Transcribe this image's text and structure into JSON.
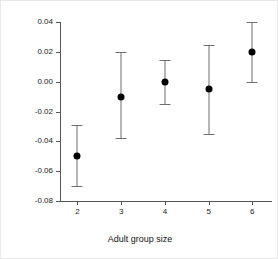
{
  "chart_data": {
    "type": "scatter",
    "title": "",
    "subtitle": "",
    "xlabel": "Adult group size",
    "ylabel": "Proportion of body mass gained",
    "categories": [
      "2",
      "3",
      "4",
      "5",
      "6"
    ],
    "x": [
      2,
      3,
      4,
      5,
      6
    ],
    "values": [
      -0.05,
      -0.01,
      0.0,
      -0.005,
      0.02
    ],
    "error_low": [
      -0.07,
      -0.0375,
      -0.015,
      -0.035,
      -0.0005
    ],
    "error_high": [
      -0.029,
      0.02,
      0.0145,
      0.0245,
      0.04
    ],
    "series": [
      {
        "name": "Proportion of body mass gained",
        "values": [
          -0.05,
          -0.01,
          0.0,
          -0.005,
          0.02
        ],
        "error_low": [
          -0.07,
          -0.0375,
          -0.015,
          -0.035,
          -0.0005
        ],
        "error_high": [
          -0.029,
          0.02,
          0.0145,
          0.0245,
          0.04
        ]
      }
    ],
    "points": [
      {
        "x": 2,
        "y": -0.05,
        "low": -0.07,
        "high": -0.029
      },
      {
        "x": 3,
        "y": -0.01,
        "low": -0.0375,
        "high": 0.02
      },
      {
        "x": 4,
        "y": 0.0,
        "low": -0.015,
        "high": 0.0145
      },
      {
        "x": 5,
        "y": -0.005,
        "low": -0.035,
        "high": 0.0245
      },
      {
        "x": 6,
        "y": 0.02,
        "low": -0.0005,
        "high": 0.04
      }
    ],
    "ylim": [
      -0.08,
      0.04
    ],
    "xlim": [
      1.6,
      6.45
    ],
    "yticks": [
      0.04,
      0.02,
      0.0,
      -0.02,
      -0.04,
      -0.06,
      -0.08
    ],
    "ytick_labels": [
      "0.04",
      "0.02",
      "0.00",
      "-0.02",
      "-0.04",
      "-0.06",
      "-0.08"
    ],
    "xticks": [
      2,
      3,
      4,
      5,
      6
    ],
    "xtick_labels": [
      "2",
      "3",
      "4",
      "5",
      "6"
    ],
    "grid": false,
    "legend": false,
    "legend_position": "none",
    "point_color": "#000000",
    "errorbar_color": "#6e6e6e",
    "axis_color": "#555555",
    "background_color": "#ffffff"
  }
}
